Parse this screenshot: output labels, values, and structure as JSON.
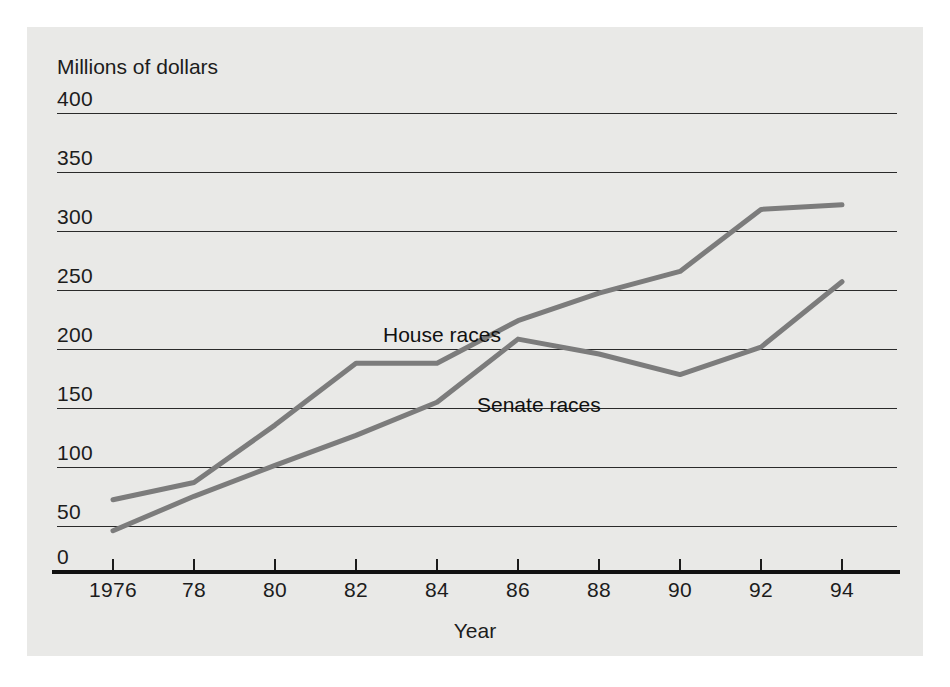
{
  "chart_data": {
    "type": "line",
    "title": "",
    "ylabel": "Millions of dollars",
    "xlabel": "Year",
    "grid": true,
    "legend_position": "inline-annotation",
    "ylim": [
      0,
      400
    ],
    "ytick_values": [
      0,
      50,
      100,
      150,
      200,
      250,
      300,
      350,
      400
    ],
    "ytick_labels": [
      "0",
      "50",
      "100",
      "150",
      "200",
      "250",
      "300",
      "350",
      "400"
    ],
    "xlim": [
      1976,
      1994
    ],
    "x": [
      1976,
      1978,
      1980,
      1982,
      1984,
      1986,
      1988,
      1990,
      1992,
      1994
    ],
    "xtick_labels": [
      "1976",
      "78",
      "80",
      "82",
      "84",
      "86",
      "88",
      "90",
      "92",
      "94"
    ],
    "series": [
      {
        "name": "House races",
        "label": "House races",
        "color": "#7c7c7c",
        "values": [
          63,
          78,
          128,
          182,
          182,
          219,
          243,
          262,
          316,
          320
        ]
      },
      {
        "name": "Senate races",
        "label": "Senate races",
        "color": "#7c7c7c",
        "values": [
          36,
          66,
          93,
          119,
          148,
          203,
          190,
          172,
          196,
          253
        ]
      }
    ]
  },
  "colors": {
    "panel_background": "#e9e9e7",
    "page_background": "#ffffff",
    "gridline": "#2a2a2a",
    "axis": "#111111",
    "text": "#1c1c1c",
    "series_line": "#7c7c7c"
  }
}
